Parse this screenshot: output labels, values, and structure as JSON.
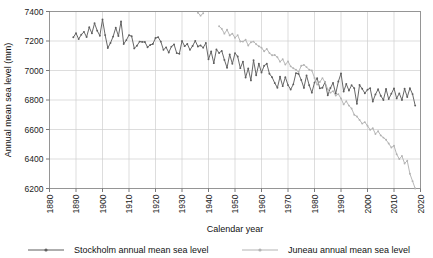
{
  "chart_data": {
    "type": "line",
    "title": "",
    "xlabel": "Calendar year",
    "ylabel": "Annual mean sea level (mm)",
    "xlim": [
      1880,
      2020
    ],
    "ylim": [
      6200,
      7400
    ],
    "xticks": [
      1880,
      1890,
      1900,
      1910,
      1920,
      1930,
      1940,
      1950,
      1960,
      1970,
      1980,
      1990,
      2000,
      2010,
      2020
    ],
    "yticks": [
      6200,
      6400,
      6600,
      6800,
      7000,
      7200,
      7400
    ],
    "grid": true,
    "legend_position": "bottom",
    "series": [
      {
        "name": "Stockholm annual mean sea level",
        "color": "#5f5f5f",
        "marker": "dot",
        "x": [
          1889,
          1890,
          1891,
          1892,
          1893,
          1894,
          1895,
          1896,
          1897,
          1898,
          1899,
          1900,
          1901,
          1902,
          1903,
          1904,
          1905,
          1906,
          1907,
          1908,
          1909,
          1910,
          1911,
          1912,
          1913,
          1914,
          1915,
          1916,
          1917,
          1918,
          1919,
          1920,
          1921,
          1922,
          1923,
          1924,
          1925,
          1926,
          1927,
          1928,
          1929,
          1930,
          1931,
          1932,
          1933,
          1934,
          1935,
          1936,
          1937,
          1938,
          1939,
          1940,
          1941,
          1942,
          1943,
          1944,
          1945,
          1946,
          1947,
          1948,
          1949,
          1950,
          1951,
          1952,
          1953,
          1954,
          1955,
          1956,
          1957,
          1958,
          1959,
          1960,
          1961,
          1962,
          1963,
          1964,
          1965,
          1966,
          1967,
          1968,
          1969,
          1970,
          1971,
          1972,
          1973,
          1974,
          1975,
          1976,
          1977,
          1978,
          1979,
          1980,
          1981,
          1982,
          1983,
          1984,
          1985,
          1986,
          1987,
          1988,
          1989,
          1990,
          1991,
          1992,
          1993,
          1994,
          1995,
          1996,
          1997,
          1998,
          1999,
          2000,
          2001,
          2002,
          2003,
          2004,
          2005,
          2006,
          2007,
          2008,
          2009,
          2010,
          2011,
          2012,
          2013,
          2014,
          2015,
          2016,
          2017,
          2018
        ],
        "y": [
          7225,
          7253,
          7213,
          7243,
          7262,
          7227,
          7293,
          7252,
          7320,
          7270,
          7236,
          7346,
          7240,
          7153,
          7186,
          7230,
          7290,
          7234,
          7332,
          7180,
          7206,
          7240,
          7232,
          7150,
          7168,
          7196,
          7194,
          7193,
          7158,
          7173,
          7180,
          7220,
          7226,
          7196,
          7140,
          7157,
          7122,
          7162,
          7177,
          7118,
          7114,
          7200,
          7165,
          7180,
          7140,
          7166,
          7201,
          7163,
          7170,
          7155,
          7186,
          7076,
          7129,
          7050,
          7143,
          7119,
          7133,
          7072,
          7019,
          7109,
          7045,
          7118,
          7095,
          7016,
          7060,
          6953,
          7014,
          6933,
          7069,
          6968,
          7046,
          6986,
          7032,
          7046,
          6978,
          6954,
          6915,
          6883,
          6958,
          6894,
          6955,
          6901,
          6871,
          6906,
          6982,
          6977,
          6936,
          6882,
          6966,
          6900,
          6850,
          6918,
          6948,
          6879,
          6883,
          6921,
          6832,
          6881,
          6916,
          6843,
          6925,
          6980,
          6858,
          6908,
          6864,
          6900,
          6880,
          6774,
          6902,
          6876,
          6846,
          6870,
          6880,
          6790,
          6838,
          6873,
          6829,
          6800,
          6875,
          6806,
          6843,
          6879,
          6811,
          6845,
          6800,
          6876,
          6820,
          6880,
          6840,
          6762
        ]
      },
      {
        "name": "Juneau annual mean sea level",
        "color": "#b3b3b3",
        "marker": "dot",
        "x": [
          1936,
          1937,
          1938,
          1944,
          1945,
          1946,
          1947,
          1948,
          1949,
          1950,
          1951,
          1952,
          1953,
          1954,
          1955,
          1956,
          1957,
          1958,
          1959,
          1960,
          1961,
          1962,
          1963,
          1964,
          1965,
          1966,
          1967,
          1968,
          1969,
          1970,
          1971,
          1972,
          1973,
          1974,
          1975,
          1976,
          1977,
          1978,
          1979,
          1980,
          1981,
          1982,
          1983,
          1984,
          1985,
          1986,
          1987,
          1988,
          1989,
          1990,
          1991,
          1992,
          1993,
          1994,
          1995,
          1996,
          1997,
          1998,
          1999,
          2000,
          2001,
          2002,
          2003,
          2004,
          2005,
          2006,
          2007,
          2008,
          2009,
          2010,
          2011,
          2012,
          2013,
          2014,
          2015,
          2016,
          2017,
          2018
        ],
        "y": [
          7392,
          7372,
          7388,
          7300,
          7283,
          7250,
          7276,
          7238,
          7250,
          7222,
          7240,
          7197,
          7196,
          7208,
          7170,
          7192,
          7196,
          7178,
          7164,
          7155,
          7130,
          7146,
          7118,
          7103,
          7105,
          7090,
          7060,
          7076,
          7040,
          7062,
          7028,
          7015,
          7005,
          6990,
          7032,
          7038,
          7023,
          7005,
          7000,
          6950,
          6905,
          6922,
          6948,
          6920,
          6872,
          6850,
          6860,
          6830,
          6840,
          6810,
          6770,
          6792,
          6762,
          6742,
          6700,
          6688,
          6665,
          6640,
          6650,
          6625,
          6598,
          6608,
          6570,
          6588,
          6560,
          6545,
          6530,
          6505,
          6478,
          6490,
          6432,
          6400,
          6420,
          6370,
          6388,
          6300,
          6250,
          6200
        ]
      }
    ]
  },
  "legend": [
    {
      "label": "Stockholm annual mean sea level",
      "color": "#5f5f5f"
    },
    {
      "label": "Juneau annual mean sea level",
      "color": "#b3b3b3"
    }
  ]
}
